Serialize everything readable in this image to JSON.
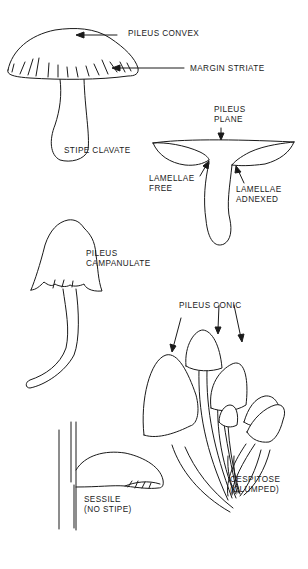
{
  "diagram": {
    "type": "mushroom-morphology-illustration",
    "figures": [
      {
        "id": "convex",
        "labels": [
          "PILEUS CONVEX",
          "MARGIN STRIATE",
          "STIPE CLAVATE"
        ]
      },
      {
        "id": "plane",
        "labels": [
          "PILEUS\nPLANE",
          "LAMELLAE\nFREE",
          "LAMELLAE\nADNEXED"
        ]
      },
      {
        "id": "campanulate",
        "labels": [
          "PILEUS\nCAMPANULATE"
        ]
      },
      {
        "id": "conic-cluster",
        "labels": [
          "PILEUS CONIC",
          "CESPITOSE\n(CLUMPED)"
        ]
      },
      {
        "id": "sessile",
        "labels": [
          "SESSILE\n(NO STIPE)"
        ]
      }
    ]
  },
  "labels": {
    "pileus_convex": "PILEUS CONVEX",
    "margin_striate": "MARGIN STRIATE",
    "stipe_clavate": "STIPE CLAVATE",
    "pileus_plane": "PILEUS\nPLANE",
    "lamellae_free": "LAMELLAE\nFREE",
    "lamellae_adnexed": "LAMELLAE\nADNEXED",
    "pileus_campanulate": "PILEUS\nCAMPANULATE",
    "pileus_conic": "PILEUS CONIC",
    "cespitose": "CESPITOSE\n(CLUMPED)",
    "sessile": "SESSILE\n(NO STIPE)"
  },
  "colors": {
    "ink": "#1a1a1a",
    "background": "#ffffff"
  }
}
